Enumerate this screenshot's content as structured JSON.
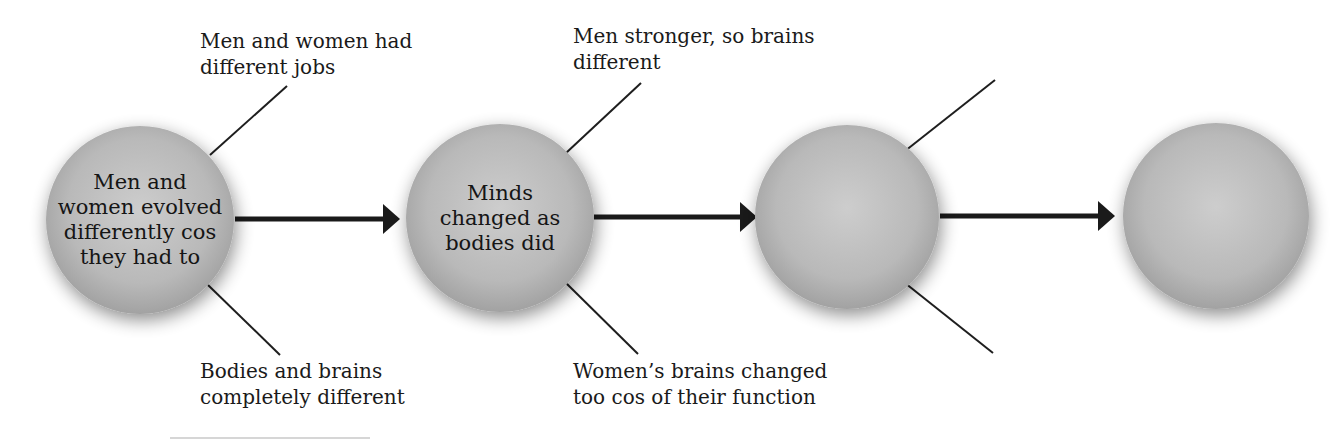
{
  "diagram": {
    "type": "flow-chain",
    "colors": {
      "node_fill": "#b8b8b8",
      "node_highlight": "#cfcfcf",
      "node_edge": "#9a9a9a",
      "line": "#1e1e1e",
      "arrow": "#1a1a1a"
    },
    "nodes": [
      {
        "id": "n1",
        "text": "Men and women evolved differently cos they had to",
        "lines": [
          "Men and",
          "women evolved",
          "differently cos",
          "they had to"
        ]
      },
      {
        "id": "n2",
        "text": "Minds changed as bodies did",
        "lines": [
          "Minds",
          "changed as",
          "bodies did"
        ]
      },
      {
        "id": "n3",
        "text": "",
        "lines": []
      },
      {
        "id": "n4",
        "text": "",
        "lines": []
      }
    ],
    "edges": [
      {
        "from": "n1",
        "to": "n2"
      },
      {
        "from": "n2",
        "to": "n3"
      },
      {
        "from": "n3",
        "to": "n4"
      }
    ],
    "branches": [
      {
        "node": "n1",
        "position": "top",
        "text": "Men and women had\ndifferent jobs"
      },
      {
        "node": "n1",
        "position": "bottom",
        "text": "Bodies and brains\ncompletely different"
      },
      {
        "node": "n2",
        "position": "top",
        "text": "Men stronger, so brains\ndifferent"
      },
      {
        "node": "n2",
        "position": "bottom",
        "text": "Women’s brains changed\ntoo cos of their function"
      },
      {
        "node": "n3",
        "position": "top",
        "text": ""
      },
      {
        "node": "n3",
        "position": "bottom",
        "text": ""
      }
    ]
  }
}
